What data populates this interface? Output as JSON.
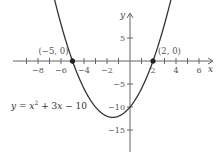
{
  "chart_data": {
    "type": "line",
    "title": "",
    "equation": "y = x^2 + 3x - 10",
    "equation_parts": {
      "y": "y",
      "eq": " = ",
      "x": "x",
      "exp": "2",
      "rest": " + 3",
      "x2": "x",
      "tail": " − 10"
    },
    "xlabel": "x",
    "ylabel": "y",
    "xlim": [
      -9.5,
      7.2
    ],
    "ylim": [
      -18.5,
      9.5
    ],
    "x_ticks": [
      -8,
      -6,
      -4,
      -2,
      2,
      4,
      6
    ],
    "x_tick_labels": [
      "−8",
      "−6",
      "−4",
      "−2",
      "2",
      "4",
      "6"
    ],
    "y_ticks": [
      5,
      -5,
      -10,
      -15
    ],
    "y_tick_labels": [
      "5",
      "−5",
      "−10",
      "−15"
    ],
    "grid": false,
    "series": [
      {
        "name": "y = x^2 + 3x - 10",
        "function": "x^2 + 3x - 10",
        "x_range": [
          -6.9,
          3.9
        ],
        "color": "#333333"
      }
    ],
    "points": [
      {
        "x": -5,
        "y": 0,
        "label": "(−5, 0)"
      },
      {
        "x": 2,
        "y": 0,
        "label": "(2, 0)"
      }
    ],
    "vertex": {
      "x": -1.5,
      "y": -12.25
    }
  }
}
